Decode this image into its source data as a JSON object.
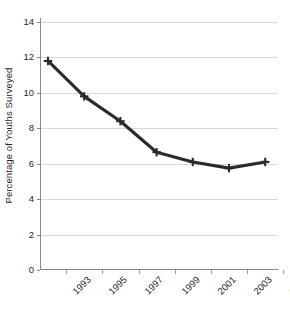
{
  "chart_data": {
    "type": "line",
    "title": "",
    "xlabel": "",
    "ylabel": "Percentage of Youths Surveyed",
    "categories": [
      "1993",
      "1995",
      "1997",
      "1999",
      "2001",
      "2003",
      "2005"
    ],
    "values": [
      11.8,
      9.8,
      8.4,
      6.65,
      6.1,
      5.75,
      6.1
    ],
    "series": [
      {
        "name": "Percentage of Youths Surveyed",
        "values": [
          11.8,
          9.8,
          8.4,
          6.65,
          6.1,
          5.75,
          6.1
        ]
      }
    ],
    "ylim": [
      0,
      14
    ],
    "yticks": [
      0,
      2,
      4,
      6,
      8,
      10,
      12,
      14
    ],
    "ytick_labels": [
      "0",
      "2",
      "4",
      "6",
      "8",
      "10",
      "12",
      "14"
    ],
    "xtick_labels": [
      "1993",
      "1995",
      "1997",
      "1999",
      "2001",
      "2003",
      "2005"
    ],
    "grid": "horizontal",
    "legend": "none",
    "line_color": "#2b2b2b",
    "marker": "plus",
    "marker_color": "#2b2b2b",
    "grid_color": "#d9d9d9",
    "axis_color": "#8a8a8a",
    "background": "#ffffff"
  },
  "axes": {
    "y_title": "Percentage of Youths Surveyed"
  },
  "caption": {
    "text": ""
  }
}
